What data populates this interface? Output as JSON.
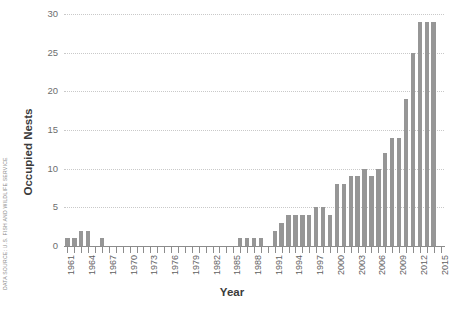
{
  "source_note": "DATA SOURCE: U.S. FISH AND WILDLIFE SERVICE",
  "colors": {
    "bar": "#969696",
    "gridline": "#c9c9c9",
    "axis": "#8c8c8c",
    "tick_label": "#6e6e6e",
    "axis_title": "#3b3b3b",
    "source_note": "#8a8a8a",
    "background": "#ffffff"
  },
  "chart_data": {
    "type": "bar",
    "title": "",
    "subtitle": "",
    "xlabel": "Year",
    "ylabel": "Occupied Nests",
    "ylim": [
      0,
      30
    ],
    "yticks": [
      0,
      5,
      10,
      15,
      20,
      25,
      30
    ],
    "ytick_labels": [
      "0",
      "5",
      "10",
      "15",
      "20",
      "25",
      "30"
    ],
    "grid": true,
    "legend": null,
    "xtick_labels": [
      "1961",
      "1964",
      "1967",
      "1970",
      "1973",
      "1976",
      "1979",
      "1982",
      "1985",
      "1988",
      "1991",
      "1994",
      "1997",
      "2000",
      "2003",
      "2006",
      "2009",
      "2012",
      "2015"
    ],
    "xtick_step": 3,
    "categories": [
      "1961",
      "1962",
      "1963",
      "1964",
      "1965",
      "1966",
      "1967",
      "1968",
      "1969",
      "1970",
      "1971",
      "1972",
      "1973",
      "1974",
      "1975",
      "1976",
      "1977",
      "1978",
      "1979",
      "1980",
      "1981",
      "1982",
      "1983",
      "1984",
      "1985",
      "1986",
      "1987",
      "1988",
      "1989",
      "1990",
      "1991",
      "1992",
      "1993",
      "1994",
      "1995",
      "1996",
      "1997",
      "1998",
      "1999",
      "2000",
      "2001",
      "2002",
      "2003",
      "2004",
      "2005",
      "2006",
      "2007",
      "2008",
      "2009",
      "2010",
      "2011",
      "2012",
      "2013",
      "2014",
      "2015"
    ],
    "values": [
      1,
      1,
      2,
      2,
      0,
      1,
      0,
      0,
      0,
      0,
      0,
      0,
      0,
      0,
      0,
      0,
      0,
      0,
      0,
      0,
      0,
      0,
      0,
      0,
      0,
      1,
      1,
      1,
      1,
      0,
      2,
      3,
      4,
      4,
      4,
      4,
      5,
      5,
      4,
      8,
      8,
      9,
      9,
      10,
      9,
      10,
      12,
      14,
      14,
      19,
      25,
      29,
      29,
      29,
      0
    ],
    "annotations": []
  }
}
